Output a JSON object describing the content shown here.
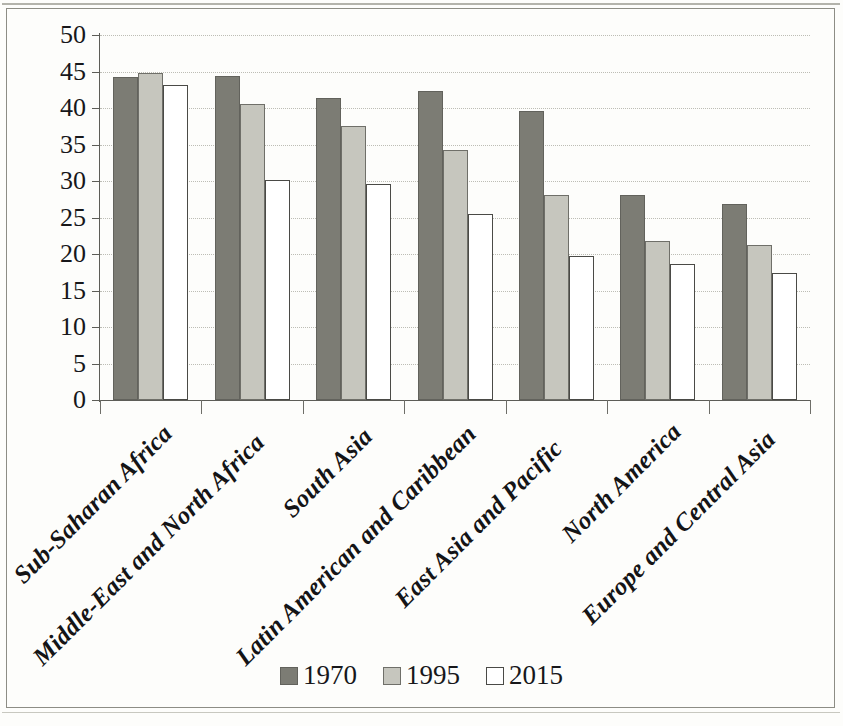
{
  "chart_data": {
    "type": "bar",
    "title": "",
    "subtitle": "",
    "xlabel": "",
    "ylabel": "",
    "ylim": [
      0,
      50
    ],
    "ytick_step": 5,
    "yticks": [
      50,
      45,
      40,
      35,
      30,
      25,
      20,
      15,
      10,
      5,
      0
    ],
    "grid": true,
    "legend_position": "bottom-center",
    "categories": [
      "Sub-Saharan Africa",
      "Middle-East and North Africa",
      "South Asia",
      "Latin American and Caribbean",
      "East Asia and Pacific",
      "North America",
      "Europe and Central Asia"
    ],
    "series": [
      {
        "name": "1970",
        "color": "#7c7c74",
        "values": [
          44.3,
          44.4,
          41.4,
          42.3,
          39.6,
          28.1,
          26.8
        ]
      },
      {
        "name": "1995",
        "color": "#c6c6be",
        "values": [
          44.8,
          40.5,
          37.6,
          34.2,
          28.1,
          21.8,
          21.2
        ]
      },
      {
        "name": "2015",
        "color": "#ffffff",
        "values": [
          43.1,
          30.1,
          29.6,
          25.5,
          19.7,
          18.6,
          17.4
        ]
      }
    ]
  },
  "legend": {
    "entries": [
      {
        "label": "1970",
        "swatch": "dark-gray-square"
      },
      {
        "label": "1995",
        "swatch": "light-gray-square"
      },
      {
        "label": "2015",
        "swatch": "white-square"
      }
    ]
  }
}
